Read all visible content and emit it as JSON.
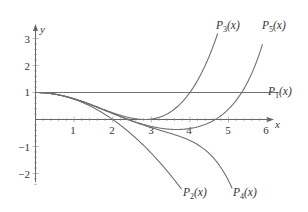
{
  "chart_data": {
    "type": "line",
    "title": "",
    "xlabel": "x",
    "ylabel": "y",
    "xlim": [
      0,
      6.3
    ],
    "ylim": [
      -2.5,
      3.3
    ],
    "grid": false,
    "legend_position": "inline labels at curve ends",
    "x_ticks": [
      "1",
      "2",
      "3",
      "4",
      "5",
      "6"
    ],
    "y_ticks": [
      "3",
      "2",
      "1",
      "-1",
      "-2"
    ],
    "series": [
      {
        "name": "P_1(x)",
        "label_main": "P",
        "label_sub": "1",
        "label_tail": "(x)",
        "coefficients": [
          1
        ],
        "x_end": 6.3
      },
      {
        "name": "P_2(x)",
        "label_main": "P",
        "label_sub": "2",
        "label_tail": "(x)",
        "coefficients": [
          1,
          -0.25
        ],
        "x_end": 3.9
      },
      {
        "name": "P_3(x)",
        "label_main": "P",
        "label_sub": "3",
        "label_tail": "(x)",
        "coefficients": [
          1,
          -0.25,
          0.015625
        ],
        "x_end": 4.72
      },
      {
        "name": "P_4(x)",
        "label_main": "P",
        "label_sub": "4",
        "label_tail": "(x)",
        "coefficients": [
          1,
          -0.25,
          0.015625,
          -0.000434028
        ],
        "x_end": 5.2
      },
      {
        "name": "P_5(x)",
        "label_main": "P",
        "label_sub": "5",
        "label_tail": "(x)",
        "coefficients": [
          1,
          -0.25,
          0.015625,
          -0.000434028,
          6.78168e-06
        ],
        "x_end": 5.88
      }
    ],
    "note": "Coefficients apply to powers of x^2 (even Taylor polynomials)."
  },
  "axes": {
    "x_label": "x",
    "y_label": "y"
  },
  "labels": {
    "p1": {
      "main": "P",
      "sub": "1",
      "tail": "(x)"
    },
    "p2": {
      "main": "P",
      "sub": "2",
      "tail": "(x)"
    },
    "p3": {
      "main": "P",
      "sub": "3",
      "tail": "(x)"
    },
    "p4": {
      "main": "P",
      "sub": "4",
      "tail": "(x)"
    },
    "p5": {
      "main": "P",
      "sub": "5",
      "tail": "(x)"
    }
  },
  "ticks": {
    "x": [
      "1",
      "2",
      "3",
      "4",
      "5",
      "6"
    ],
    "y_pos": [
      "1",
      "2",
      "3"
    ],
    "y_neg": [
      "−1",
      "−2"
    ]
  },
  "colors": {
    "axis": "#555555",
    "curve": "#707070",
    "text": "#333333"
  }
}
